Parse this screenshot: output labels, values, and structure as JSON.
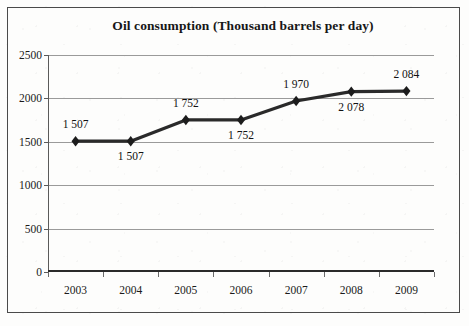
{
  "chart_data": {
    "type": "line",
    "title": "Oil consumption (Thousand barrels per day)",
    "xlabel": "",
    "ylabel": "",
    "categories": [
      "2003",
      "2004",
      "2005",
      "2006",
      "2007",
      "2008",
      "2009"
    ],
    "values": [
      1507,
      1507,
      1752,
      1752,
      1970,
      2078,
      2084
    ],
    "data_labels": [
      "1 507",
      "1 507",
      "1 752",
      "1 752",
      "1 970",
      "2 078",
      "2 084"
    ],
    "data_label_positions": [
      "above",
      "below",
      "above",
      "below",
      "above",
      "below",
      "above"
    ],
    "ylim": [
      0,
      2500
    ],
    "yticks": [
      0,
      500,
      1000,
      1500,
      2000,
      2500
    ],
    "ytick_labels": [
      "0",
      "500",
      "1000",
      "1500",
      "2000",
      "2500"
    ],
    "grid": true,
    "legend": "none",
    "marker": "diamond",
    "series": [
      {
        "name": "Oil consumption",
        "values": [
          1507,
          1507,
          1752,
          1752,
          1970,
          2078,
          2084
        ]
      }
    ],
    "colors": {
      "line": "#2a2a2a",
      "marker": "#1c1c1c",
      "grid": "#9a9a9a",
      "axis": "#3a3a3a",
      "text": "#171717"
    }
  }
}
